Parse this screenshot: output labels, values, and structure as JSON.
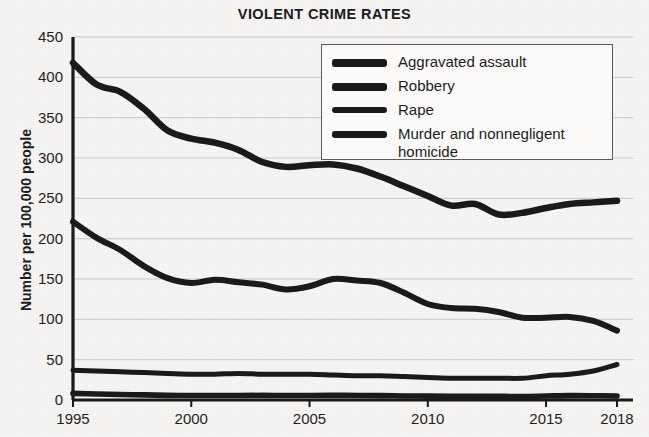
{
  "chart_data": {
    "type": "line",
    "title": "VIOLENT CRIME RATES",
    "xlabel": "",
    "ylabel": "Number per 100,000 people",
    "ylim": [
      0,
      450
    ],
    "xlim": [
      1995,
      2018
    ],
    "yticks": [
      0,
      50,
      100,
      150,
      200,
      250,
      300,
      350,
      400,
      450
    ],
    "ytick_labels": [
      "0",
      "50",
      "100",
      "150",
      "200",
      "250",
      "300",
      "350",
      "400",
      "450"
    ],
    "xticks": [
      1995,
      2000,
      2005,
      2010,
      2015,
      2018
    ],
    "xtick_labels": [
      "1995",
      "2000",
      "2005",
      "2010",
      "2015",
      "2018"
    ],
    "grid": "horizontal",
    "legend_position": "top-right",
    "line_color": "#1a1a1a",
    "x": [
      1995,
      1996,
      1997,
      1998,
      1999,
      2000,
      2001,
      2002,
      2003,
      2004,
      2005,
      2006,
      2007,
      2008,
      2009,
      2010,
      2011,
      2012,
      2013,
      2014,
      2015,
      2016,
      2017,
      2018
    ],
    "series": [
      {
        "name": "Aggravated assault",
        "values": [
          418,
          391,
          382,
          361,
          334,
          324,
          319,
          310,
          295,
          289,
          291,
          292,
          287,
          277,
          265,
          253,
          241,
          243,
          230,
          232,
          238,
          243,
          245,
          247
        ]
      },
      {
        "name": "Robbery",
        "values": [
          221,
          201,
          186,
          166,
          151,
          145,
          149,
          146,
          143,
          137,
          141,
          150,
          148,
          145,
          133,
          119,
          114,
          113,
          109,
          102,
          102,
          103,
          98,
          86
        ]
      },
      {
        "name": "Rape",
        "values": [
          37,
          36,
          35,
          34,
          33,
          32,
          32,
          33,
          32,
          32,
          32,
          31,
          30,
          30,
          29,
          28,
          27,
          27,
          27,
          27,
          30,
          32,
          36,
          44
        ]
      },
      {
        "name": "Murder and nonnegligent\nhomicide",
        "values": [
          8.2,
          7.4,
          6.8,
          6.3,
          5.7,
          5.5,
          5.6,
          5.6,
          5.7,
          5.5,
          5.6,
          5.7,
          5.6,
          5.4,
          5.0,
          4.8,
          4.7,
          4.7,
          4.5,
          4.4,
          4.9,
          5.4,
          5.3,
          5.0
        ]
      }
    ]
  }
}
